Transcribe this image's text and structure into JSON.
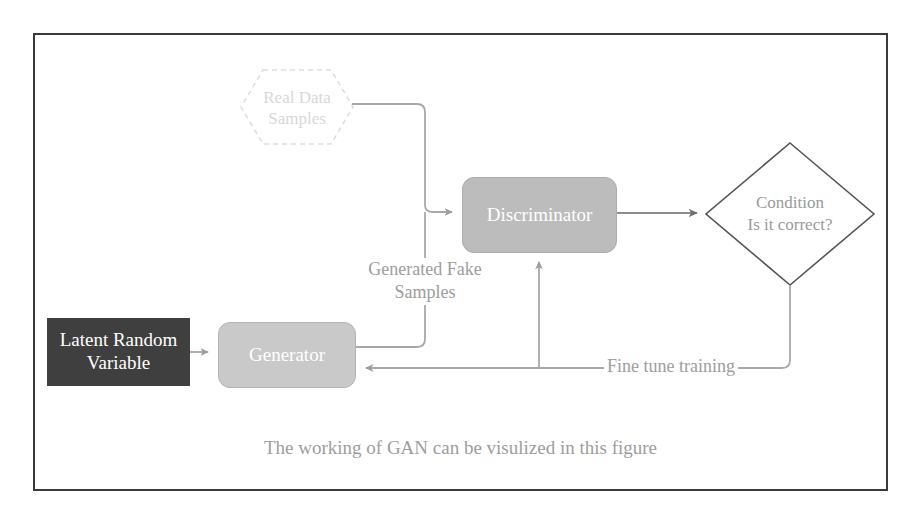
{
  "diagram": {
    "caption": "The working of GAN can be visulized in this figure",
    "colors": {
      "frame_border": "#3a3a3a",
      "latent_fill": "#3f3f3f",
      "latent_text": "#ffffff",
      "generator_fill": "#c9c9c9",
      "discriminator_fill": "#bcbcbc",
      "node_text": "#ffffff",
      "hexagon_stroke": "#e0e0e0",
      "hexagon_text": "#d8d8d8",
      "diamond_stroke": "#5a5a5a",
      "diamond_text": "#9a9a9a",
      "connector": "#a8a8a8",
      "label_text": "#9d9d9d",
      "background": "#ffffff"
    },
    "nodes": {
      "latent": {
        "label_line1": "Latent Random",
        "label_line2": "Variable",
        "shape": "rectangle"
      },
      "generator": {
        "label": "Generator",
        "shape": "rounded-rectangle"
      },
      "discriminator": {
        "label": "Discriminator",
        "shape": "rounded-rectangle"
      },
      "real_data": {
        "label_line1": "Real Data",
        "label_line2": "Samples",
        "shape": "hexagon-dashed"
      },
      "condition": {
        "label_line1": "Condition",
        "label_line2": "Is it correct?",
        "shape": "diamond"
      }
    },
    "edges": {
      "generated_fake_samples": {
        "label_line1": "Generated Fake",
        "label_line2": "Samples"
      },
      "fine_tune_training": {
        "label": "Fine tune training"
      }
    }
  }
}
